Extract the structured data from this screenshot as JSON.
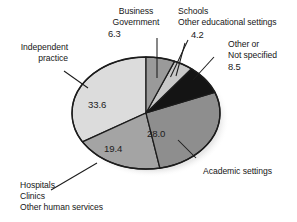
{
  "chart_data": {
    "type": "pie",
    "title": "",
    "subtitle": "",
    "xlabel": "",
    "ylabel": "",
    "grid": false,
    "legend_position": "callout-labels",
    "units": "percent",
    "total": 100.0,
    "start_angle_deg": 0,
    "direction": "clockwise",
    "categories": [
      "Business\nGovernment",
      "Schools\nOther educational settings",
      "Other or\nNot specified",
      "Academic settings",
      "Hospitals\nClinics\nOther human services",
      "Independent\npractice"
    ],
    "values": [
      6.3,
      4.2,
      8.5,
      28.0,
      19.4,
      33.6
    ],
    "slices": [
      {
        "label": "Business Government",
        "label_lines": [
          "Business",
          "Government"
        ],
        "value": 6.3,
        "value_text": "6.3",
        "color": "#9a9a9a",
        "start_deg": 0.0,
        "end_deg": 22.7
      },
      {
        "label": "Schools Other educational settings",
        "label_lines": [
          "Schools",
          "Other educational settings"
        ],
        "value": 4.2,
        "value_text": "4.2",
        "color": "#c8c8c8",
        "start_deg": 22.7,
        "end_deg": 37.8
      },
      {
        "label": "Other or Not specified",
        "label_lines": [
          "Other or",
          "Not specified"
        ],
        "value": 8.5,
        "value_text": "8.5",
        "color": "#141414",
        "start_deg": 37.8,
        "end_deg": 68.4
      },
      {
        "label": "Academic settings",
        "label_lines": [
          "Academic settings"
        ],
        "value": 28.0,
        "value_text": "28.0",
        "color": "#8e8e8e",
        "start_deg": 68.4,
        "end_deg": 169.2
      },
      {
        "label": "Hospitals Clinics Other human services",
        "label_lines": [
          "Hospitals",
          "Clinics",
          "Other human services"
        ],
        "value": 19.4,
        "value_text": "19.4",
        "color": "#a4a4a4",
        "start_deg": 169.2,
        "end_deg": 239.0
      },
      {
        "label": "Independent practice",
        "label_lines": [
          "Independent",
          "practice"
        ],
        "value": 33.6,
        "value_text": "33.6",
        "color": "#dcdcdc",
        "start_deg": 239.0,
        "end_deg": 360.0
      }
    ]
  },
  "callouts": {
    "business_government": {
      "line1": "Business",
      "line2": "Government",
      "value": "6.3"
    },
    "schools": {
      "line1": "Schools",
      "line2": "Other educational settings",
      "value": "4.2"
    },
    "other_not_specified": {
      "line1": "Other or",
      "line2": "Not specified",
      "value": "8.5"
    },
    "academic_settings": {
      "line1": "Academic settings"
    },
    "hospitals": {
      "line1": "Hospitals",
      "line2": "Clinics",
      "line3": "Other human services"
    },
    "independent_practice": {
      "line1": "Independent",
      "line2": "practice"
    }
  },
  "slice_values": {
    "independent_practice": "33.6",
    "hospitals": "19.4",
    "academic": "28.0"
  },
  "colors": {
    "outline": "#1c1c1c",
    "shadow": "#c6c6c6",
    "background": "#ffffff",
    "text": "#161616"
  }
}
